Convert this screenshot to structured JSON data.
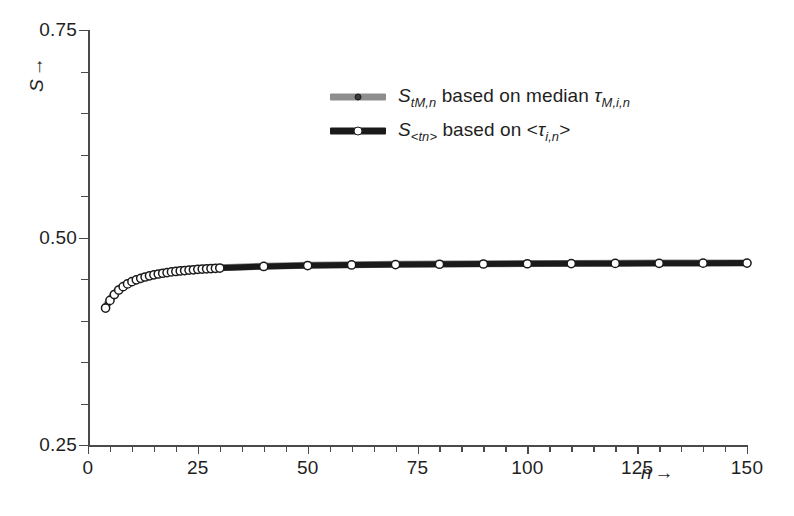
{
  "chart_data": {
    "type": "line",
    "title": "",
    "xlabel": "n",
    "ylabel": "S",
    "xlim": [
      0,
      150
    ],
    "ylim": [
      0.25,
      0.75
    ],
    "grid": false,
    "legend_position": "upper-center",
    "x_ticks": [
      0,
      25,
      50,
      75,
      100,
      125,
      150
    ],
    "x_tick_labels": [
      "0",
      "25",
      "50",
      "75",
      "100",
      "125",
      "150"
    ],
    "x_minor_step": 5,
    "y_ticks": [
      0.25,
      0.5,
      0.75
    ],
    "y_tick_labels": [
      "0.25",
      "0.50",
      "0.75"
    ],
    "y_minor_step": 0.05,
    "series": [
      {
        "name": "S_tM,n based on median tau_M,i,n",
        "color": "#8e8e8e",
        "marker": "circle-small-dark",
        "x": [
          4,
          5,
          6,
          7,
          8,
          9,
          10,
          11,
          12,
          13,
          14,
          15,
          16,
          17,
          18,
          19,
          20,
          21,
          22,
          23,
          24,
          25,
          26,
          27,
          28,
          29,
          30,
          40,
          50,
          60,
          70,
          80,
          90,
          100,
          110,
          120,
          130,
          140,
          150
        ],
        "values": [
          0.4165,
          0.4255,
          0.4325,
          0.4378,
          0.4418,
          0.445,
          0.4476,
          0.4497,
          0.4515,
          0.4531,
          0.4544,
          0.4556,
          0.4566,
          0.4575,
          0.4583,
          0.459,
          0.4597,
          0.4603,
          0.4608,
          0.4613,
          0.4617,
          0.4621,
          0.4625,
          0.4628,
          0.4631,
          0.4634,
          0.4637,
          0.4655,
          0.4665,
          0.4672,
          0.4677,
          0.4681,
          0.4684,
          0.4686,
          0.4688,
          0.469,
          0.4692,
          0.4693,
          0.4694
        ]
      },
      {
        "name": "S_<tn> based on <tau_i,n>",
        "color": "#1a1a1a",
        "marker": "circle-open-white",
        "x": [
          4,
          5,
          6,
          7,
          8,
          9,
          10,
          11,
          12,
          13,
          14,
          15,
          16,
          17,
          18,
          19,
          20,
          21,
          22,
          23,
          24,
          25,
          26,
          27,
          28,
          29,
          30,
          40,
          50,
          60,
          70,
          80,
          90,
          100,
          110,
          120,
          130,
          140,
          150
        ],
        "values": [
          0.415,
          0.4242,
          0.4313,
          0.4367,
          0.4408,
          0.4441,
          0.4468,
          0.449,
          0.4508,
          0.4524,
          0.4538,
          0.455,
          0.456,
          0.4569,
          0.4577,
          0.4585,
          0.4591,
          0.4597,
          0.4602,
          0.4607,
          0.4611,
          0.4616,
          0.4619,
          0.4623,
          0.4626,
          0.4629,
          0.4632,
          0.4651,
          0.4662,
          0.4669,
          0.4674,
          0.4678,
          0.4681,
          0.4684,
          0.4686,
          0.4688,
          0.4689,
          0.4691,
          0.4692
        ]
      }
    ]
  },
  "axes": {
    "y_title_symbol": "S",
    "y_title_arrow": "→",
    "x_title_symbol": "n",
    "x_title_arrow": "→"
  },
  "legend": {
    "entries": [
      {
        "symbol": "S",
        "symbol_sub": "tM,n",
        "middle": " based on median ",
        "tail_symbol": "τ",
        "tail_sub": "M,i,n",
        "tail_suffix": "",
        "tail_prefix": "",
        "line_color": "#8e8e8e",
        "marker_fill": "#3a3a3a",
        "marker_stroke": "#1a1a1a",
        "marker_size": 7,
        "line_thickness": 7
      },
      {
        "symbol": "S",
        "symbol_sub": "<tn>",
        "middle": " based on ",
        "tail_symbol": "τ",
        "tail_sub": "i,n",
        "tail_prefix": "<",
        "tail_suffix": ">",
        "line_color": "#1a1a1a",
        "marker_fill": "#ffffff",
        "marker_stroke": "#1a1a1a",
        "marker_size": 9,
        "line_thickness": 7
      }
    ]
  }
}
